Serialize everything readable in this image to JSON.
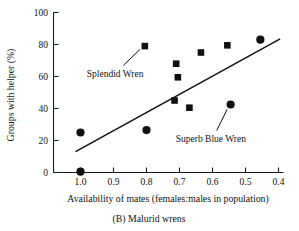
{
  "chart_data": {
    "type": "scatter",
    "title": "",
    "caption": "(B) Malurid wrens",
    "xlabel": "Availability of mates (females:males in population)",
    "ylabel": "Groups with helper (%)",
    "xlim": [
      1.07,
      0.38
    ],
    "ylim": [
      0,
      100
    ],
    "x_reversed": true,
    "grid": false,
    "legend": "none",
    "xticks": [
      "1.0",
      "0.9",
      "0.8",
      "0.7",
      "0.6",
      "0.5",
      "0.4"
    ],
    "xtick_values": [
      1.0,
      0.9,
      0.8,
      0.7,
      0.6,
      0.5,
      0.4
    ],
    "yticks": [
      "0",
      "20",
      "40",
      "60",
      "80",
      "100"
    ],
    "ytick_values": [
      0,
      20,
      40,
      60,
      80,
      100
    ],
    "series": [
      {
        "name": "circle-points",
        "marker": "circle",
        "color": "#111111",
        "points": [
          {
            "x": 1.0,
            "y": 0.5
          },
          {
            "x": 1.0,
            "y": 25.0
          },
          {
            "x": 0.8,
            "y": 26.5
          },
          {
            "x": 0.545,
            "y": 42.5
          },
          {
            "x": 0.455,
            "y": 83.0
          }
        ]
      },
      {
        "name": "square-points",
        "marker": "square",
        "color": "#111111",
        "points": [
          {
            "x": 0.805,
            "y": 79.0
          },
          {
            "x": 0.71,
            "y": 68.0
          },
          {
            "x": 0.705,
            "y": 59.5
          },
          {
            "x": 0.715,
            "y": 45.0
          },
          {
            "x": 0.67,
            "y": 40.5
          },
          {
            "x": 0.635,
            "y": 75.0
          },
          {
            "x": 0.555,
            "y": 79.5
          }
        ]
      }
    ],
    "trendline": {
      "name": "regression-line",
      "x_start": 1.015,
      "y_start": 13.0,
      "x_end": 0.395,
      "y_end": 83.5
    },
    "annotations": [
      {
        "label": "Splendid Wren",
        "text_x": 0.895,
        "text_y": 60.0,
        "target_x": 0.805,
        "target_y": 79.0
      },
      {
        "label": "Superb Blue Wren",
        "text_x": 0.605,
        "text_y": 19.0,
        "target_x": 0.545,
        "target_y": 42.5
      }
    ]
  },
  "figure": {
    "caption": "(B) Malurid wrens",
    "xlabel": "Availability of mates (females:males in population)",
    "ylabel": "Groups with helper (%)",
    "xticks": [
      "1.0",
      "0.9",
      "0.8",
      "0.7",
      "0.6",
      "0.5",
      "0.4"
    ],
    "yticks": [
      "100",
      "80",
      "60",
      "40",
      "20",
      "0"
    ],
    "annotation_splendid": "Splendid Wren",
    "annotation_superb": "Superb Blue Wren"
  }
}
